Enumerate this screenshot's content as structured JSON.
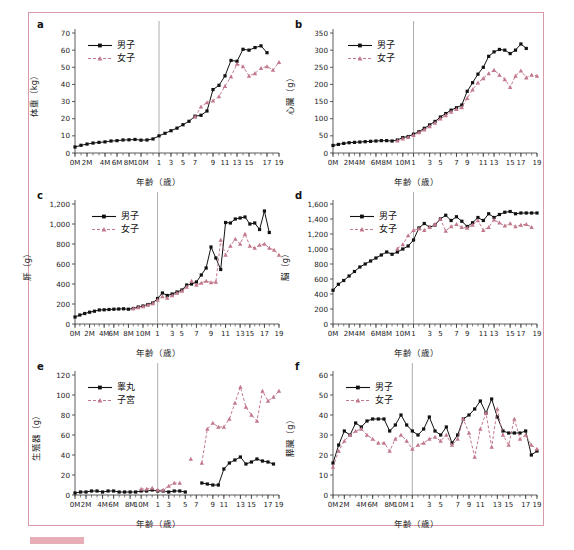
{
  "figure": {
    "border_color": "#d89aa6",
    "boys_color": "#111111",
    "girls_color": "#c2798c",
    "xlabel": "年齢（歳）",
    "xticks": [
      "0M",
      "2M",
      "4M",
      "6M",
      "8M",
      "10M",
      "1",
      "3",
      "5",
      "7",
      "9",
      "11",
      "13",
      "15",
      "17",
      "19"
    ],
    "legend_boys": "男子",
    "legend_girls": "女子",
    "legend_testis": "睾丸",
    "legend_uterus": "子宮"
  },
  "chart_data": [
    {
      "panel": "a",
      "type": "line",
      "title": "",
      "ylabel": "体重（kg）",
      "xlabel": "年齢（歳）",
      "ylim": [
        0,
        70
      ],
      "yticks": [
        0,
        10,
        20,
        30,
        40,
        50,
        60,
        70
      ],
      "ytick_labels": [
        "0",
        "10",
        "20",
        "30",
        "40",
        "50",
        "60",
        "70"
      ],
      "x": [
        "0M",
        "1M",
        "2M",
        "3M",
        "4M",
        "5M",
        "6M",
        "7M",
        "8M",
        "9M",
        "10M",
        "11M",
        "1",
        "2",
        "3",
        "4",
        "5",
        "6",
        "7",
        "8",
        "9",
        "10",
        "11",
        "12",
        "13",
        "14",
        "15",
        "16",
        "17",
        "18",
        "19",
        "20"
      ],
      "xticks": [
        "0M",
        "2M",
        "4M",
        "6M",
        "8M",
        "10M",
        "1",
        "3",
        "5",
        "7",
        "9",
        "11",
        "13",
        "15",
        "17",
        "19"
      ],
      "divider_x": "1",
      "series": [
        {
          "name": "男子",
          "color": "#111111",
          "style": "solid",
          "marker": "square",
          "values": [
            3.5,
            4.5,
            5.2,
            5.8,
            6.2,
            6.5,
            7.0,
            7.2,
            7.6,
            7.7,
            7.9,
            7.5,
            7.6,
            8.2,
            10.0,
            11.5,
            13.0,
            14.5,
            16.5,
            18.5,
            21.5,
            22.0,
            24.5,
            37.0,
            39.5,
            45.0,
            54.0,
            53.5,
            60.5,
            60.0,
            61.5,
            62.5,
            58.5
          ]
        },
        {
          "name": "女子",
          "color": "#c2798c",
          "style": "dashed",
          "marker": "triangle",
          "values": [
            null,
            null,
            null,
            null,
            null,
            null,
            null,
            null,
            null,
            null,
            null,
            null,
            null,
            null,
            null,
            null,
            null,
            null,
            null,
            null,
            21.0,
            27.0,
            29.5,
            30.5,
            33.0,
            39.0,
            44.5,
            52.0,
            50.5,
            45.0,
            46.5,
            49.5,
            50.5,
            48.5,
            53.0
          ]
        }
      ]
    },
    {
      "panel": "b",
      "type": "line",
      "ylabel": "心臓（g）",
      "xlabel": "年齢（歳）",
      "ylim": [
        0,
        350
      ],
      "yticks": [
        0,
        50,
        100,
        150,
        200,
        250,
        300,
        350
      ],
      "ytick_labels": [
        "0",
        "50",
        "100",
        "150",
        "200",
        "250",
        "300",
        "350"
      ],
      "xticks": [
        "0M",
        "2M",
        "4M",
        "6M",
        "8M",
        "10M",
        "1",
        "3",
        "5",
        "7",
        "9",
        "11",
        "13",
        "15",
        "17",
        "19"
      ],
      "series": [
        {
          "name": "男子",
          "color": "#111111",
          "style": "solid",
          "marker": "square",
          "values": [
            22,
            25,
            28,
            30,
            31,
            32,
            33,
            34,
            35,
            36,
            36,
            35,
            38,
            45,
            48,
            55,
            62,
            72,
            82,
            92,
            105,
            115,
            125,
            132,
            140,
            180,
            205,
            230,
            250,
            282,
            295,
            302,
            300,
            290,
            300,
            318,
            305
          ]
        },
        {
          "name": "女子",
          "color": "#c2798c",
          "style": "dashed",
          "marker": "triangle",
          "values": [
            null,
            null,
            null,
            null,
            null,
            null,
            null,
            null,
            null,
            null,
            null,
            null,
            36,
            42,
            46,
            52,
            60,
            68,
            78,
            88,
            100,
            110,
            120,
            128,
            133,
            160,
            185,
            205,
            218,
            232,
            242,
            228,
            215,
            192,
            225,
            240,
            220,
            228,
            225
          ]
        }
      ]
    },
    {
      "panel": "c",
      "type": "line",
      "ylabel": "肝（g）",
      "xlabel": "年齢（歳）",
      "ylim": [
        0,
        1200
      ],
      "yticks": [
        0,
        200,
        400,
        600,
        800,
        1000,
        1200
      ],
      "ytick_labels": [
        "0",
        "200",
        "400",
        "600",
        "800",
        "1,000",
        "1,200"
      ],
      "xticks": [
        "0M",
        "2M",
        "4M",
        "6M",
        "8M",
        "10M",
        "1",
        "3",
        "5",
        "7",
        "9",
        "11",
        "13",
        "15",
        "17",
        "19"
      ],
      "series": [
        {
          "name": "男子",
          "color": "#111111",
          "style": "solid",
          "marker": "square",
          "values": [
            70,
            90,
            105,
            118,
            128,
            140,
            142,
            145,
            148,
            150,
            152,
            148,
            155,
            170,
            180,
            195,
            210,
            255,
            310,
            285,
            300,
            320,
            340,
            390,
            400,
            420,
            490,
            560,
            770,
            660,
            545,
            1015,
            1010,
            1050,
            1060,
            1070,
            1000,
            1010,
            945,
            1130,
            915
          ]
        },
        {
          "name": "女子",
          "color": "#c2798c",
          "style": "dashed",
          "marker": "triangle",
          "values": [
            null,
            null,
            null,
            null,
            null,
            null,
            null,
            null,
            null,
            null,
            null,
            null,
            155,
            165,
            175,
            190,
            205,
            240,
            275,
            260,
            285,
            310,
            330,
            370,
            430,
            390,
            410,
            430,
            415,
            420,
            840,
            690,
            780,
            850,
            800,
            900,
            780,
            760,
            790,
            800,
            760,
            740,
            690
          ]
        }
      ]
    },
    {
      "panel": "d",
      "type": "line",
      "ylabel": "脳（g）",
      "xlabel": "年齢（歳）",
      "ylim": [
        0,
        1600
      ],
      "yticks": [
        0,
        200,
        400,
        600,
        800,
        1000,
        1200,
        1400,
        1600
      ],
      "ytick_labels": [
        "0",
        "200",
        "400",
        "600",
        "800",
        "1,000",
        "1,200",
        "1,400",
        "1,600"
      ],
      "xticks": [
        "0M",
        "2M",
        "4M",
        "6M",
        "8M",
        "10M",
        "1",
        "3",
        "5",
        "7",
        "9",
        "11",
        "13",
        "15",
        "17",
        "19"
      ],
      "series": [
        {
          "name": "男子",
          "color": "#111111",
          "style": "solid",
          "marker": "square",
          "values": [
            450,
            530,
            580,
            640,
            700,
            760,
            800,
            840,
            880,
            920,
            960,
            930,
            960,
            1000,
            1040,
            1120,
            1280,
            1340,
            1290,
            1320,
            1400,
            1450,
            1380,
            1430,
            1370,
            1300,
            1350,
            1420,
            1380,
            1470,
            1420,
            1460,
            1490,
            1500,
            1470,
            1480,
            1480,
            1480,
            1480
          ]
        },
        {
          "name": "女子",
          "color": "#c2798c",
          "style": "dashed",
          "marker": "triangle",
          "values": [
            null,
            null,
            null,
            null,
            null,
            null,
            null,
            null,
            null,
            null,
            null,
            null,
            1005,
            1060,
            1180,
            1250,
            1270,
            1250,
            1290,
            1330,
            1400,
            1240,
            1300,
            1330,
            1290,
            1280,
            1320,
            1380,
            1250,
            1290,
            1390,
            1350,
            1310,
            1340,
            1300,
            1320,
            1330,
            1290
          ]
        }
      ]
    },
    {
      "panel": "e",
      "type": "line",
      "ylabel": "生殖器（g）",
      "xlabel": "年齢（歳）",
      "ylim": [
        0,
        120
      ],
      "yticks": [
        0,
        20,
        40,
        60,
        80,
        100,
        120
      ],
      "ytick_labels": [
        "0",
        "20",
        "40",
        "60",
        "80",
        "100",
        "120"
      ],
      "xticks": [
        "0M",
        "2M",
        "4M",
        "6M",
        "8M",
        "10M",
        "1",
        "3",
        "5",
        "7",
        "9",
        "11",
        "13",
        "15",
        "17",
        "19"
      ],
      "series": [
        {
          "name": "睾丸",
          "color": "#111111",
          "style": "solid",
          "marker": "square",
          "values": [
            2,
            3,
            3,
            4,
            4,
            3,
            4,
            4,
            3,
            3,
            3,
            3,
            4,
            4,
            5,
            4,
            4,
            3,
            4,
            4,
            3,
            null,
            null,
            12,
            11,
            10,
            10,
            26,
            32,
            35,
            38,
            31,
            33,
            36,
            34,
            33,
            31
          ]
        },
        {
          "name": "子宮",
          "color": "#c2798c",
          "style": "dashed",
          "marker": "triangle",
          "values": [
            null,
            null,
            null,
            null,
            null,
            null,
            null,
            null,
            null,
            null,
            null,
            null,
            6,
            6,
            7,
            5,
            5,
            9,
            12,
            12,
            null,
            36,
            null,
            32,
            66,
            72,
            68,
            68,
            76,
            92,
            108,
            88,
            80,
            74,
            104,
            94,
            98,
            104
          ]
        }
      ]
    },
    {
      "panel": "f",
      "type": "line",
      "ylabel": "膵臓（g）",
      "xlabel": "年齢（歳）",
      "ylim": [
        0,
        60
      ],
      "yticks": [
        0,
        10,
        20,
        30,
        40,
        50,
        60
      ],
      "ytick_labels": [
        "0",
        "10",
        "20",
        "30",
        "40",
        "50",
        "60"
      ],
      "xticks": [
        "0M",
        "2M",
        "4M",
        "6M",
        "8M",
        "10M",
        "1",
        "3",
        "5",
        "7",
        "9",
        "11",
        "13",
        "15",
        "17",
        "19"
      ],
      "series": [
        {
          "name": "男子",
          "color": "#111111",
          "style": "solid",
          "marker": "square",
          "values": [
            16,
            25,
            32,
            30,
            36,
            34,
            37,
            38,
            38,
            38,
            32,
            35,
            40,
            35,
            32,
            30,
            33,
            39,
            32,
            30,
            34,
            26,
            30,
            38,
            40,
            43,
            47,
            41,
            48,
            39,
            32,
            31,
            31,
            31,
            32,
            20,
            22
          ]
        },
        {
          "name": "女子",
          "color": "#c2798c",
          "style": "dashed",
          "marker": "triangle",
          "values": [
            14,
            22,
            27,
            30,
            32,
            33,
            30,
            28,
            26,
            26,
            22,
            28,
            30,
            27,
            23,
            25,
            26,
            28,
            29,
            27,
            30,
            25,
            28,
            38,
            31,
            19,
            33,
            41,
            24,
            43,
            30,
            25,
            38,
            28,
            30,
            25,
            23
          ]
        }
      ]
    }
  ]
}
